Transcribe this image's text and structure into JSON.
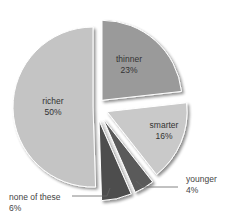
{
  "chart_data": {
    "type": "pie",
    "exploded": true,
    "start_angle_deg": 0,
    "direction": "clockwise",
    "slices": [
      {
        "label": "thinner",
        "value": 23,
        "display": "23%",
        "color": "#9a9a9a",
        "label_position": "inside"
      },
      {
        "label": "smarter",
        "value": 16,
        "display": "16%",
        "color": "#c9c9c9",
        "label_position": "inside"
      },
      {
        "label": "younger",
        "value": 4,
        "display": "4%",
        "color": "#5a5a5a",
        "label_position": "outside-right"
      },
      {
        "label": "none of these",
        "value": 6,
        "display": "6%",
        "color": "#4e4e4e",
        "label_position": "outside-left"
      },
      {
        "label": "richer",
        "value": 50,
        "display": "50%",
        "color": "#c4c4c4",
        "label_position": "inside"
      }
    ],
    "title": "",
    "legend": "none"
  },
  "labels": {
    "thinner": {
      "name": "thinner",
      "pct": "23%"
    },
    "smarter": {
      "name": "smarter",
      "pct": "16%"
    },
    "younger": {
      "name": "younger",
      "pct": "4%"
    },
    "none": {
      "name": "none of these",
      "pct": "6%"
    },
    "richer": {
      "name": "richer",
      "pct": "50%"
    }
  }
}
